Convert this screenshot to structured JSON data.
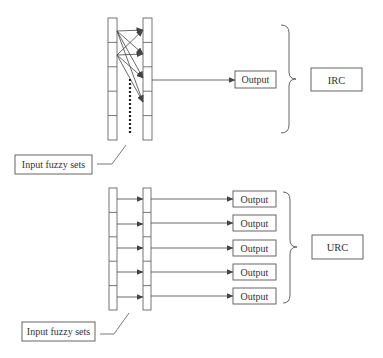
{
  "colors": {
    "stroke": "#555555",
    "text": "#333333",
    "background": "#ffffff"
  },
  "irc": {
    "label": "IRC",
    "output_label": "Output",
    "input_label": "Input fuzzy sets",
    "segments": 5,
    "dotted_connector": true
  },
  "urc": {
    "label": "URC",
    "outputs": [
      "Output",
      "Output",
      "Output",
      "Output",
      "Output"
    ],
    "input_label": "Input fuzzy sets",
    "segments": 5
  }
}
